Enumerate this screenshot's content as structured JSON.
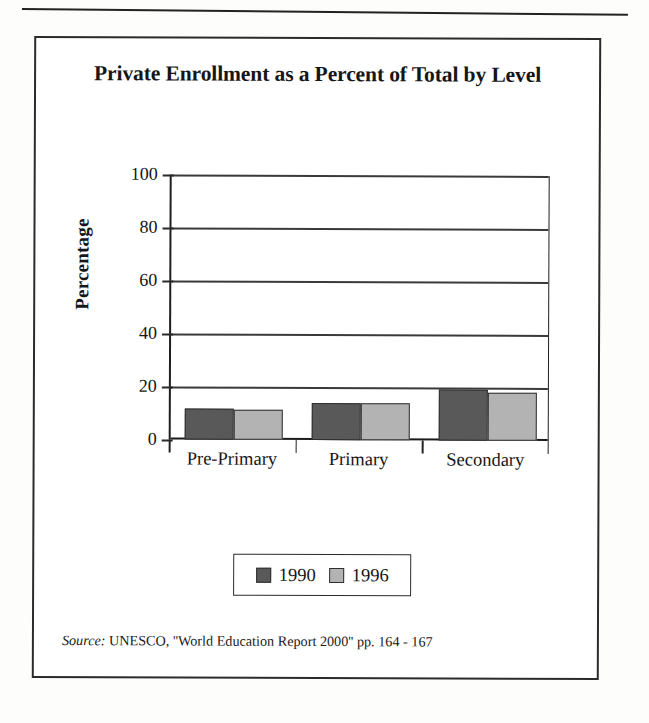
{
  "page": {
    "has_top_rule": true
  },
  "figure": {
    "title": "Private Enrollment as a Percent of Total by Level",
    "source_label": "Source:",
    "source_text": " UNESCO, ''World Education Report 2000'' pp. 164 - 167"
  },
  "legend": {
    "entries": [
      {
        "label": "1990",
        "color": "#595959"
      },
      {
        "label": "1996",
        "color": "#b3b3b3"
      }
    ]
  },
  "chart_data": {
    "type": "bar",
    "title": "Private Enrollment as a Percent of Total by Level",
    "xlabel": "",
    "ylabel": "Percentage",
    "categories": [
      "Pre-Primary",
      "Primary",
      "Secondary"
    ],
    "series": [
      {
        "name": "1990",
        "color": "#595959",
        "values": [
          11.8,
          14.0,
          19.4
        ]
      },
      {
        "name": "1996",
        "color": "#b3b3b3",
        "values": [
          11.5,
          13.8,
          18.0
        ]
      }
    ],
    "ylim": [
      0,
      100
    ],
    "yticks": [
      0,
      20,
      40,
      60,
      80,
      100
    ],
    "ytick_labels": [
      "0",
      "20",
      "40",
      "60",
      "80",
      "100"
    ],
    "grid": true,
    "grid_axis": "y",
    "legend_position": "bottom",
    "source": "Source: UNESCO, ''World Education Report 2000'' pp. 164 - 167"
  }
}
